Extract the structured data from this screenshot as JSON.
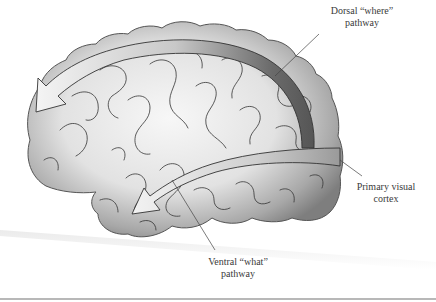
{
  "figure": {
    "labels": {
      "dorsal": {
        "line1": "Dorsal “where”",
        "line2": "pathway"
      },
      "primary": {
        "line1": "Primary visual",
        "line2": "cortex"
      },
      "ventral": {
        "line1": "Ventral “what”",
        "line2": "pathway"
      }
    },
    "colors": {
      "background": "#ffffff",
      "brain_fill_light": "#f2f2f2",
      "brain_fill_dark": "#8c8c8c",
      "arrow_light": "#eeeeee",
      "arrow_dark": "#6e6e6e",
      "outline": "#333333",
      "text": "#3a3a3a",
      "rule": "#b8b8b8"
    }
  }
}
